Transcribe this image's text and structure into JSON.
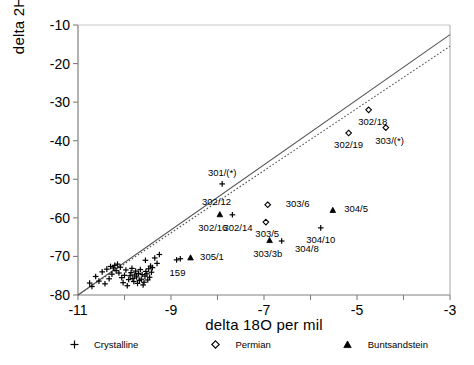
{
  "chart_data": {
    "type": "scatter",
    "title": "",
    "xlabel": "delta 18O  per mil",
    "ylabel": "delta 2H  per mil",
    "xlim": [
      -11,
      -3
    ],
    "ylim": [
      -80,
      -10
    ],
    "xticks": [
      -11,
      -10,
      -9,
      -8,
      -7,
      -6,
      -5,
      -4,
      -3
    ],
    "xticklabels": [
      "-11",
      "",
      "-9",
      "",
      "-7",
      "",
      "-5",
      "",
      "-3"
    ],
    "yticks": [
      -80,
      -70,
      -60,
      -50,
      -40,
      -30,
      -20,
      -10
    ],
    "yticklabels": [
      "-80",
      "-70",
      "-60",
      "-50",
      "-40",
      "-30",
      "-20",
      "-10"
    ],
    "grid": false,
    "legend_position": "below-axes",
    "legend": [
      {
        "label": "Crystalline",
        "marker": "plus"
      },
      {
        "label": "Permian",
        "marker": "diamond"
      },
      {
        "label": "Buntsandstein",
        "marker": "triangle"
      }
    ],
    "lines": [
      {
        "name": "global-meteoric-water-line",
        "style": "solid",
        "points": [
          [
            -11,
            -80
          ],
          [
            -3,
            -12.5
          ]
        ]
      },
      {
        "name": "local-meteoric-water-line",
        "style": "dotted",
        "points": [
          [
            -11,
            -80
          ],
          [
            -3,
            -15.5
          ]
        ]
      }
    ],
    "series": [
      {
        "name": "Crystalline",
        "marker": "plus",
        "points": [
          {
            "x": -10.62,
            "y": -75.2
          },
          {
            "x": -10.55,
            "y": -76.4
          },
          {
            "x": -10.48,
            "y": -74.0
          },
          {
            "x": -10.42,
            "y": -77.1
          },
          {
            "x": -10.38,
            "y": -73.3
          },
          {
            "x": -10.33,
            "y": -75.8
          },
          {
            "x": -10.3,
            "y": -72.6
          },
          {
            "x": -10.27,
            "y": -74.6
          },
          {
            "x": -10.24,
            "y": -73.0
          },
          {
            "x": -10.21,
            "y": -72.3
          },
          {
            "x": -10.18,
            "y": -73.7
          },
          {
            "x": -10.15,
            "y": -72.0
          },
          {
            "x": -10.12,
            "y": -74.3
          },
          {
            "x": -10.09,
            "y": -72.8
          },
          {
            "x": -10.06,
            "y": -75.5
          },
          {
            "x": -10.03,
            "y": -76.8
          },
          {
            "x": -10.0,
            "y": -74.9
          },
          {
            "x": -9.97,
            "y": -73.5
          },
          {
            "x": -9.94,
            "y": -77.6
          },
          {
            "x": -9.91,
            "y": -76.0
          },
          {
            "x": -9.88,
            "y": -75.0
          },
          {
            "x": -9.86,
            "y": -74.2
          },
          {
            "x": -9.84,
            "y": -73.1
          },
          {
            "x": -9.82,
            "y": -75.7
          },
          {
            "x": -9.8,
            "y": -76.5
          },
          {
            "x": -9.78,
            "y": -74.8
          },
          {
            "x": -9.76,
            "y": -73.8
          },
          {
            "x": -9.74,
            "y": -75.3
          },
          {
            "x": -9.72,
            "y": -77.0
          },
          {
            "x": -9.7,
            "y": -74.4
          },
          {
            "x": -9.68,
            "y": -76.2
          },
          {
            "x": -9.66,
            "y": -73.4
          },
          {
            "x": -9.64,
            "y": -75.9
          },
          {
            "x": -9.62,
            "y": -74.7
          },
          {
            "x": -9.6,
            "y": -77.4
          },
          {
            "x": -9.58,
            "y": -76.7
          },
          {
            "x": -9.56,
            "y": -75.1
          },
          {
            "x": -9.54,
            "y": -73.9
          },
          {
            "x": -9.52,
            "y": -74.5
          },
          {
            "x": -9.5,
            "y": -76.1
          },
          {
            "x": -9.48,
            "y": -73.2
          },
          {
            "x": -9.46,
            "y": -75.4
          },
          {
            "x": -9.44,
            "y": -72.5
          },
          {
            "x": -9.42,
            "y": -74.1
          },
          {
            "x": -9.4,
            "y": -72.9
          },
          {
            "x": -9.55,
            "y": -71.0
          },
          {
            "x": -9.35,
            "y": -70.4
          },
          {
            "x": -9.3,
            "y": -71.8
          },
          {
            "x": -9.25,
            "y": -69.5
          },
          {
            "x": -10.7,
            "y": -77.8
          },
          {
            "x": -10.75,
            "y": -76.9
          },
          {
            "x": -8.88,
            "y": -70.9
          },
          {
            "x": -8.8,
            "y": -70.6
          },
          {
            "x": -7.9,
            "y": -51.2
          },
          {
            "x": -7.68,
            "y": -59.2
          },
          {
            "x": -6.62,
            "y": -66.0
          },
          {
            "x": -5.78,
            "y": -62.6
          }
        ]
      },
      {
        "name": "Permian",
        "marker": "diamond",
        "points": [
          {
            "x": -6.92,
            "y": -56.6
          },
          {
            "x": -6.96,
            "y": -61.1
          },
          {
            "x": -4.75,
            "y": -32.0
          },
          {
            "x": -5.18,
            "y": -38.0
          },
          {
            "x": -4.38,
            "y": -36.6
          }
        ]
      },
      {
        "name": "Buntsandstein",
        "marker": "triangle",
        "points": [
          {
            "x": -8.58,
            "y": -70.3
          },
          {
            "x": -7.95,
            "y": -59.1
          },
          {
            "x": -6.88,
            "y": -65.8
          },
          {
            "x": -5.52,
            "y": -58.0
          }
        ]
      }
    ],
    "annotations": [
      {
        "text": "301/(*)",
        "x": -7.9,
        "y": -48.3,
        "anchor": "center"
      },
      {
        "text": "302/18",
        "x": -4.66,
        "y": -35.2,
        "anchor": "center"
      },
      {
        "text": "302/19",
        "x": -5.18,
        "y": -41.2,
        "anchor": "center"
      },
      {
        "text": "303/(*)",
        "x": -4.3,
        "y": -40.0,
        "anchor": "center"
      },
      {
        "text": "303/6",
        "x": -6.62,
        "y": -56.3,
        "anchor": "left"
      },
      {
        "text": "303/5",
        "x": -6.93,
        "y": -64.2,
        "anchor": "center"
      },
      {
        "text": "304/5",
        "x": -5.36,
        "y": -57.7,
        "anchor": "left"
      },
      {
        "text": "304/10",
        "x": -5.78,
        "y": -65.7,
        "anchor": "center"
      },
      {
        "text": "304/8",
        "x": -6.42,
        "y": -68.0,
        "anchor": "left"
      },
      {
        "text": "303/3b",
        "x": -6.92,
        "y": -69.4,
        "anchor": "center"
      },
      {
        "text": "302/12",
        "x": -8.02,
        "y": -56.0,
        "anchor": "center"
      },
      {
        "text": "302/16",
        "x": -8.1,
        "y": -62.7,
        "anchor": "center"
      },
      {
        "text": "302/14",
        "x": -7.56,
        "y": -62.5,
        "anchor": "center"
      },
      {
        "text": "305/1",
        "x": -8.46,
        "y": -70.1,
        "anchor": "left"
      },
      {
        "text": "159",
        "x": -8.86,
        "y": -74.2,
        "anchor": "center"
      }
    ]
  },
  "colors": {
    "axis": "#808080",
    "marker": "#000000",
    "line": "#555555",
    "background": "#ffffff"
  }
}
